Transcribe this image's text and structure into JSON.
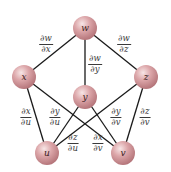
{
  "diagram": {
    "type": "tree diagram (chain rule)",
    "colors": {
      "node_fill": "#d9a0a3",
      "node_highlight": "#f4dcdc",
      "node_edge": "#b07075",
      "line": "#1a1a1a",
      "text": "#3a3a3a"
    },
    "nodes": [
      {
        "id": "w",
        "label": "w",
        "x": 85,
        "y": 28
      },
      {
        "id": "x",
        "label": "x",
        "x": 24,
        "y": 77
      },
      {
        "id": "y",
        "label": "y",
        "x": 85,
        "y": 97
      },
      {
        "id": "z",
        "label": "z",
        "x": 146,
        "y": 77
      },
      {
        "id": "u",
        "label": "u",
        "x": 47,
        "y": 153
      },
      {
        "id": "v",
        "label": "v",
        "x": 123,
        "y": 153
      }
    ],
    "edges": [
      {
        "from": "w",
        "to": "x",
        "num": "∂w",
        "den": "∂x",
        "lx": 46,
        "ly": 44
      },
      {
        "from": "w",
        "to": "y",
        "num": "∂w",
        "den": "∂y",
        "lx": 95,
        "ly": 64
      },
      {
        "from": "w",
        "to": "z",
        "num": "∂w",
        "den": "∂z",
        "lx": 124,
        "ly": 44
      },
      {
        "from": "x",
        "to": "u",
        "num": "∂x",
        "den": "∂u",
        "lx": 26,
        "ly": 117
      },
      {
        "from": "y",
        "to": "u",
        "num": "∂y",
        "den": "∂u",
        "lx": 55,
        "ly": 117
      },
      {
        "from": "z",
        "to": "u",
        "num": "∂z",
        "den": "∂u",
        "lx": 73,
        "ly": 143
      },
      {
        "from": "x",
        "to": "v",
        "num": "∂x",
        "den": "∂v",
        "lx": 98,
        "ly": 143
      },
      {
        "from": "y",
        "to": "v",
        "num": "∂y",
        "den": "∂v",
        "lx": 116,
        "ly": 117
      },
      {
        "from": "z",
        "to": "v",
        "num": "∂z",
        "den": "∂v",
        "lx": 145,
        "ly": 117
      }
    ]
  }
}
